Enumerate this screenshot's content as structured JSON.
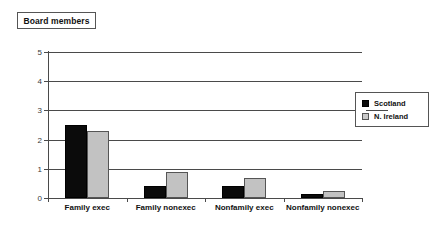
{
  "title": {
    "label": "Board members"
  },
  "legend": {
    "position": "right",
    "entries": [
      {
        "label": "Scotland",
        "swatch": "black-square-icon",
        "color": "#0b0b0b"
      },
      {
        "label": "N. Ireland",
        "swatch": "gray-square-icon",
        "color": "#c2c2c2"
      }
    ]
  },
  "axes": {
    "y_ticks": [
      "0",
      "1",
      "2",
      "3",
      "4",
      "5"
    ],
    "x_labels": [
      "Family exec",
      "Family nonexec",
      "Nonfamily exec",
      "Nonfamily nonexec"
    ]
  },
  "chart_data": {
    "type": "bar",
    "title": "Board members",
    "xlabel": "",
    "ylabel": "",
    "ylim": [
      0,
      5
    ],
    "yticks": [
      0,
      1,
      2,
      3,
      4,
      5
    ],
    "grid": true,
    "legend_position": "right",
    "categories": [
      "Family exec",
      "Family nonexec",
      "Nonfamily exec",
      "Nonfamily nonexec"
    ],
    "series": [
      {
        "name": "Scotland",
        "color": "#0b0b0b",
        "values": [
          2.5,
          0.4,
          0.4,
          0.13
        ]
      },
      {
        "name": "N. Ireland",
        "color": "#c2c2c2",
        "values": [
          2.3,
          0.9,
          0.67,
          0.25
        ]
      }
    ]
  }
}
